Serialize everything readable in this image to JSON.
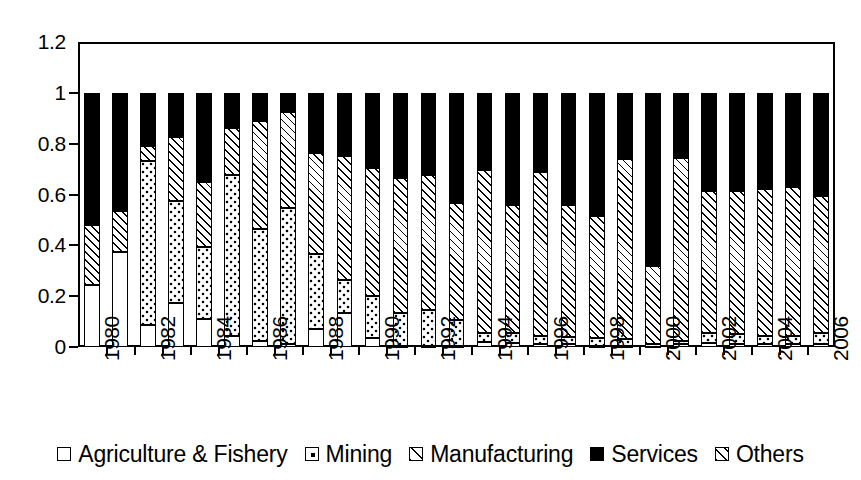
{
  "chart_data": {
    "type": "bar",
    "subtype": "stacked-bar-100pct",
    "title": "",
    "xlabel": "",
    "ylabel": "",
    "ylim": [
      0,
      1.2
    ],
    "y_ticks": [
      "0",
      "0.2",
      "0.4",
      "0.6",
      "0.8",
      "1",
      "1.2"
    ],
    "y_tick_values": [
      0,
      0.2,
      0.4,
      0.6,
      0.8,
      1.0,
      1.2
    ],
    "grid": false,
    "legend_position": "bottom",
    "categories": [
      "1980",
      "1981",
      "1982",
      "1983",
      "1984",
      "1985",
      "1986",
      "1987",
      "1988",
      "1989",
      "1990",
      "1991",
      "1992",
      "1993",
      "1994",
      "1995",
      "1996",
      "1997",
      "1998",
      "1999",
      "2000",
      "2001",
      "2002",
      "2003",
      "2004",
      "2005",
      "2006"
    ],
    "x_tick_labels_shown": [
      "1980",
      "1982",
      "1984",
      "1986",
      "1988",
      "1990",
      "1992",
      "1994",
      "1996",
      "1998",
      "2000",
      "2002",
      "2004",
      "2006"
    ],
    "series": [
      {
        "name": "Agriculture & Fishery",
        "pattern": "empty",
        "values": [
          0.245,
          0.375,
          0.085,
          0.175,
          0.11,
          0.045,
          0.025,
          0.01,
          0.07,
          0.135,
          0.035,
          0.005,
          0.005,
          0.005,
          0.02,
          0.015,
          0.01,
          0.01,
          0.005,
          0.005,
          0.005,
          0.01,
          0.015,
          0.01,
          0.01,
          0.01,
          0.01
        ]
      },
      {
        "name": "Mining",
        "pattern": "dotted",
        "values": [
          0.0,
          0.0,
          0.645,
          0.4,
          0.285,
          0.63,
          0.44,
          0.535,
          0.295,
          0.13,
          0.165,
          0.13,
          0.14,
          0.1,
          0.035,
          0.04,
          0.035,
          0.03,
          0.03,
          0.025,
          0.005,
          0.015,
          0.04,
          0.04,
          0.035,
          0.035,
          0.045
        ]
      },
      {
        "name": "Manufacturing",
        "pattern": "hatch-light",
        "values": [
          0.0,
          0.0,
          0.0,
          0.0,
          0.0,
          0.0,
          0.0,
          0.0,
          0.0,
          0.0,
          0.0,
          0.0,
          0.0,
          0.0,
          0.0,
          0.0,
          0.0,
          0.0,
          0.0,
          0.0,
          0.0,
          0.0,
          0.0,
          0.0,
          0.0,
          0.0,
          0.0
        ]
      },
      {
        "name": "Services",
        "pattern": "solid-black",
        "values": [
          0.52,
          0.465,
          0.21,
          0.175,
          0.35,
          0.14,
          0.11,
          0.075,
          0.235,
          0.25,
          0.295,
          0.335,
          0.325,
          0.435,
          0.305,
          0.44,
          0.31,
          0.44,
          0.485,
          0.26,
          0.68,
          0.255,
          0.385,
          0.385,
          0.38,
          0.37,
          0.405
        ]
      },
      {
        "name": "Others",
        "pattern": "hatch",
        "values": [
          0.235,
          0.16,
          0.06,
          0.25,
          0.255,
          0.185,
          0.425,
          0.38,
          0.4,
          0.485,
          0.505,
          0.53,
          0.53,
          0.46,
          0.64,
          0.505,
          0.645,
          0.52,
          0.48,
          0.71,
          0.31,
          0.72,
          0.56,
          0.565,
          0.575,
          0.585,
          0.54
        ]
      }
    ],
    "stack_tops": {
      "note": "cumulative upper edge of each stacked segment per year",
      "1980": {
        "agriculture": 0.245,
        "mining": 0.245,
        "manufacturing": 0.245,
        "others": 0.48,
        "services": 1.0
      },
      "1981": {
        "agriculture": 0.375,
        "mining": 0.375,
        "manufacturing": 0.375,
        "others": 0.535,
        "services": 1.0
      },
      "1982": {
        "agriculture": 0.085,
        "mining": 0.73,
        "manufacturing": 0.73,
        "others": 0.79,
        "services": 1.0
      },
      "1983": {
        "agriculture": 0.175,
        "mining": 0.575,
        "manufacturing": 0.575,
        "others": 0.825,
        "services": 1.0
      },
      "1984": {
        "agriculture": 0.11,
        "mining": 0.395,
        "manufacturing": 0.395,
        "others": 0.65,
        "services": 1.0
      },
      "1985": {
        "agriculture": 0.045,
        "mining": 0.675,
        "manufacturing": 0.675,
        "others": 0.86,
        "services": 1.0
      },
      "1986": {
        "agriculture": 0.025,
        "mining": 0.465,
        "manufacturing": 0.465,
        "others": 0.89,
        "services": 1.0
      },
      "1987": {
        "agriculture": 0.01,
        "mining": 0.545,
        "manufacturing": 0.545,
        "others": 0.925,
        "services": 1.0
      },
      "1988": {
        "agriculture": 0.07,
        "mining": 0.365,
        "manufacturing": 0.365,
        "others": 0.765,
        "services": 1.0
      },
      "1989": {
        "agriculture": 0.135,
        "mining": 0.265,
        "manufacturing": 0.265,
        "others": 0.75,
        "services": 1.0
      },
      "1990": {
        "agriculture": 0.035,
        "mining": 0.2,
        "manufacturing": 0.2,
        "others": 0.705,
        "services": 1.0
      },
      "1991": {
        "agriculture": 0.005,
        "mining": 0.135,
        "manufacturing": 0.135,
        "others": 0.665,
        "services": 1.0
      },
      "1992": {
        "agriculture": 0.005,
        "mining": 0.145,
        "manufacturing": 0.145,
        "others": 0.675,
        "services": 1.0
      },
      "1993": {
        "agriculture": 0.005,
        "mining": 0.105,
        "manufacturing": 0.105,
        "others": 0.565,
        "services": 1.0
      },
      "1994": {
        "agriculture": 0.02,
        "mining": 0.055,
        "manufacturing": 0.055,
        "others": 0.695,
        "services": 1.0
      },
      "1995": {
        "agriculture": 0.015,
        "mining": 0.055,
        "manufacturing": 0.055,
        "others": 0.56,
        "services": 1.0
      },
      "1996": {
        "agriculture": 0.01,
        "mining": 0.045,
        "manufacturing": 0.045,
        "others": 0.69,
        "services": 1.0
      },
      "1997": {
        "agriculture": 0.01,
        "mining": 0.04,
        "manufacturing": 0.04,
        "others": 0.56,
        "services": 1.0
      },
      "1998": {
        "agriculture": 0.005,
        "mining": 0.035,
        "manufacturing": 0.035,
        "others": 0.515,
        "services": 1.0
      },
      "1999": {
        "agriculture": 0.005,
        "mining": 0.03,
        "manufacturing": 0.03,
        "others": 0.74,
        "services": 1.0
      },
      "2000": {
        "agriculture": 0.005,
        "mining": 0.01,
        "manufacturing": 0.01,
        "others": 0.32,
        "services": 1.0
      },
      "2001": {
        "agriculture": 0.01,
        "mining": 0.025,
        "manufacturing": 0.025,
        "others": 0.745,
        "services": 1.0
      },
      "2002": {
        "agriculture": 0.015,
        "mining": 0.055,
        "manufacturing": 0.055,
        "others": 0.615,
        "services": 1.0
      },
      "2003": {
        "agriculture": 0.01,
        "mining": 0.05,
        "manufacturing": 0.05,
        "others": 0.615,
        "services": 1.0
      },
      "2004": {
        "agriculture": 0.01,
        "mining": 0.045,
        "manufacturing": 0.045,
        "others": 0.62,
        "services": 1.0
      },
      "2005": {
        "agriculture": 0.01,
        "mining": 0.045,
        "manufacturing": 0.045,
        "others": 0.63,
        "services": 1.0
      },
      "2006": {
        "agriculture": 0.01,
        "mining": 0.055,
        "manufacturing": 0.055,
        "others": 0.595,
        "services": 1.0
      }
    }
  },
  "legend": {
    "items": [
      {
        "label": "Agriculture & Fishery",
        "pattern": "empty"
      },
      {
        "label": "Mining",
        "pattern": "dotted"
      },
      {
        "label": "Manufacturing",
        "pattern": "hatch-light"
      },
      {
        "label": "Services",
        "pattern": "solid-black"
      },
      {
        "label": "Others",
        "pattern": "hatch"
      }
    ]
  },
  "colors": {
    "axis": "#000000",
    "plot_background": "#ffffff",
    "series_fill": "#000000"
  }
}
